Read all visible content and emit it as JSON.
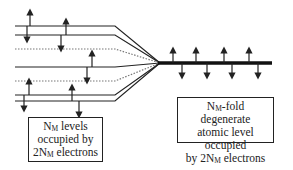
{
  "diagram": {
    "left_label": {
      "line1_main": "N",
      "line1_sub": "M",
      "line1_rest": " levels",
      "line2": "occupied by",
      "line3_main": "2N",
      "line3_sub": "M",
      "line3_rest": " electrons"
    },
    "right_label": {
      "line1_main": "N",
      "line1_sub": "M",
      "line1_rest": "-fold degenerate",
      "line2": "atomic level occupied",
      "line3_pre": "by 2N",
      "line3_sub": "M",
      "line3_rest": " electrons"
    },
    "split_levels": [
      {
        "y": 26,
        "style": "solid"
      },
      {
        "y": 35,
        "style": "solid"
      },
      {
        "y": 49,
        "style": "dotted"
      },
      {
        "y": 67,
        "style": "solid"
      },
      {
        "y": 81,
        "style": "dotted"
      },
      {
        "y": 95,
        "style": "solid"
      },
      {
        "y": 101,
        "style": "solid"
      }
    ],
    "colors": {
      "line": "#222222",
      "dotted": "#666666",
      "background": "#ffffff"
    }
  }
}
